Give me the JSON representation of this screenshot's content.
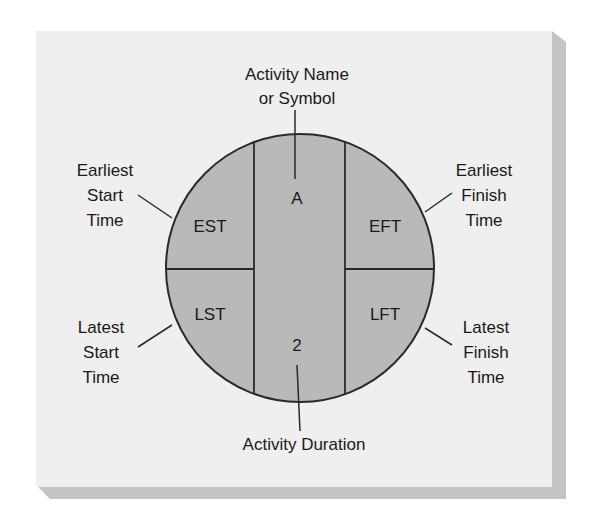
{
  "diagram": {
    "colors": {
      "background": "#ffffff",
      "panel": "#efefef",
      "panel_shadow": "#c4c4c4",
      "node_fill": "#b9b9b9",
      "stroke": "#2a2a2a",
      "text": "#1a1a1a"
    },
    "node": {
      "activity_name": "A",
      "duration": "2",
      "est": "EST",
      "eft": "EFT",
      "lst": "LST",
      "lft": "LFT"
    },
    "callouts": {
      "top": [
        "Activity Name",
        "or Symbol"
      ],
      "bottom": [
        "Activity Duration"
      ],
      "upper_left": [
        "Earliest",
        "Start",
        "Time"
      ],
      "lower_left": [
        "Latest",
        "Start",
        "Time"
      ],
      "upper_right": [
        "Earliest",
        "Finish",
        "Time"
      ],
      "lower_right": [
        "Latest",
        "Finish",
        "Time"
      ]
    }
  }
}
